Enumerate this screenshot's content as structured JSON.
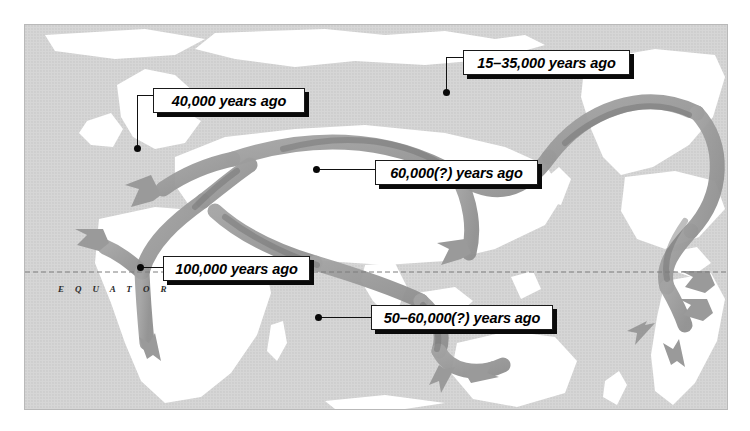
{
  "map": {
    "title": "Early human migration routes world map",
    "equator_label": "E Q U A T O R",
    "colors": {
      "ocean": "#d6d6d6",
      "land": "#ffffff",
      "arrow": "#9a9a9a",
      "arrow_dark": "#7b7b7b",
      "label_box": "#ffffff",
      "label_shadow": "#0a0a0a",
      "leader_line": "#111111",
      "frame_border": "#b9b9b9"
    },
    "callouts": [
      {
        "id": "callout-40000",
        "text": "40,000 years ago",
        "region": "Europe",
        "box": {
          "x": 153,
          "y": 88,
          "w": 152,
          "h": 25
        },
        "dot": {
          "x": 137,
          "y": 148
        }
      },
      {
        "id": "callout-15-35000",
        "text": "15–35,000 years ago",
        "region": "Beringia / North America",
        "box": {
          "x": 463,
          "y": 50,
          "w": 167,
          "h": 25
        },
        "dot": {
          "x": 446,
          "y": 92
        }
      },
      {
        "id": "callout-60000",
        "text": "60,000(?) years ago",
        "region": "East Asia",
        "box": {
          "x": 375,
          "y": 160,
          "w": 163,
          "h": 25
        },
        "dot": {
          "x": 316,
          "y": 169
        }
      },
      {
        "id": "callout-100000",
        "text": "100,000 years ago",
        "region": "Africa origin",
        "box": {
          "x": 163,
          "y": 256,
          "w": 147,
          "h": 25
        },
        "dot": {
          "x": 141,
          "y": 267
        }
      },
      {
        "id": "callout-50-60000",
        "text": "50–60,000(?) years ago",
        "region": "Australia",
        "box": {
          "x": 371,
          "y": 305,
          "w": 182,
          "h": 25
        },
        "dot": {
          "x": 318,
          "y": 317
        }
      }
    ]
  }
}
